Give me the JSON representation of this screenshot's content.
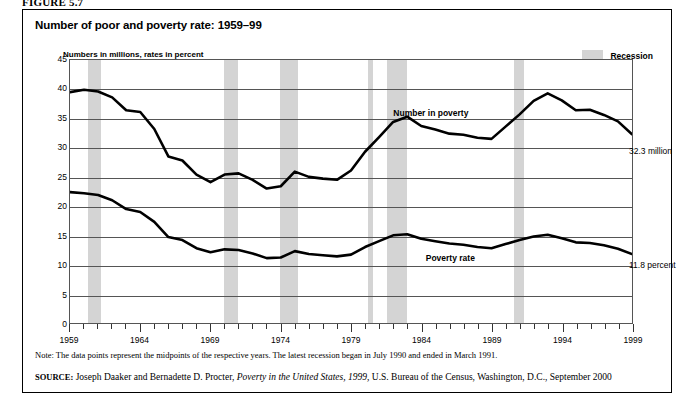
{
  "figure": {
    "figure_label": "FIGURE 5.7",
    "title": "Number of poor and poverty rate: 1959–99",
    "axis_caption": "Numbers in millions, rates in percent",
    "note": "Note: The data points represent the midpoints of the respective years. The latest recession began in July 1990 and ended in March 1991.",
    "source_prefix": "SOURCE:",
    "source_text_1": "Joseph Daaker and Bernadette D. Procter,",
    "source_italic": "Poverty in the United States, 1999,",
    "source_text_2": "U.S. Bureau of the Census, Washington, D.C., September 2000"
  },
  "legend": {
    "recession_label": "Recession",
    "recession_color": "#d4d4d4"
  },
  "annotations": {
    "number_in_poverty_label": "Number in poverty",
    "poverty_rate_label": "Poverty rate",
    "end_value_number": "32.3 million",
    "end_value_rate": "11.8 percent"
  },
  "chart_data": {
    "type": "line",
    "title": "Number of poor and poverty rate: 1959–99",
    "xlabel": "",
    "ylabel": "Numbers in millions, rates in percent",
    "xlim": [
      1959,
      1999
    ],
    "ylim": [
      0,
      45
    ],
    "yticks": [
      0,
      5,
      10,
      15,
      20,
      25,
      30,
      35,
      40,
      45
    ],
    "xticks_major": [
      1959,
      1964,
      1969,
      1974,
      1979,
      1984,
      1989,
      1994,
      1999
    ],
    "xtick_labels": [
      "1959",
      "1964",
      "1969",
      "1974",
      "1979",
      "1984",
      "1989",
      "1994",
      "1999"
    ],
    "grid": true,
    "legend_position": "top-right",
    "x": [
      1959,
      1960,
      1961,
      1962,
      1963,
      1964,
      1965,
      1966,
      1967,
      1968,
      1969,
      1970,
      1971,
      1972,
      1973,
      1974,
      1975,
      1976,
      1977,
      1978,
      1979,
      1980,
      1981,
      1982,
      1983,
      1984,
      1985,
      1986,
      1987,
      1988,
      1989,
      1990,
      1991,
      1992,
      1993,
      1994,
      1995,
      1996,
      1997,
      1998,
      1999
    ],
    "series": [
      {
        "name": "Number in poverty",
        "units": "millions",
        "color": "#000000",
        "values": [
          39.5,
          39.9,
          39.6,
          38.6,
          36.4,
          36.1,
          33.2,
          28.5,
          27.8,
          25.4,
          24.1,
          25.4,
          25.6,
          24.5,
          23.0,
          23.4,
          25.9,
          25.0,
          24.7,
          24.5,
          26.1,
          29.3,
          31.8,
          34.4,
          35.3,
          33.7,
          33.1,
          32.4,
          32.2,
          31.7,
          31.5,
          33.6,
          35.7,
          38.0,
          39.3,
          38.1,
          36.4,
          36.5,
          35.6,
          34.5,
          32.3
        ]
      },
      {
        "name": "Poverty rate",
        "units": "percent",
        "color": "#000000",
        "values": [
          22.4,
          22.2,
          21.9,
          21.0,
          19.5,
          19.0,
          17.3,
          14.7,
          14.2,
          12.8,
          12.1,
          12.6,
          12.5,
          11.9,
          11.1,
          11.2,
          12.3,
          11.8,
          11.6,
          11.4,
          11.7,
          13.0,
          14.0,
          15.0,
          15.2,
          14.4,
          14.0,
          13.6,
          13.4,
          13.0,
          12.8,
          13.5,
          14.2,
          14.8,
          15.1,
          14.5,
          13.8,
          13.7,
          13.3,
          12.7,
          11.8
        ]
      }
    ],
    "recession_bands": [
      {
        "start": 1960.3,
        "end": 1961.2
      },
      {
        "start": 1969.9,
        "end": 1970.9
      },
      {
        "start": 1973.9,
        "end": 1975.2
      },
      {
        "start": 1980.1,
        "end": 1980.5
      },
      {
        "start": 1981.5,
        "end": 1982.9
      },
      {
        "start": 1990.5,
        "end": 1991.2
      }
    ]
  }
}
